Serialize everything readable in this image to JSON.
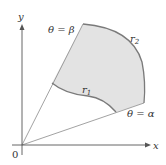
{
  "diagram": {
    "type": "polar region",
    "axes": {
      "x_label": "x",
      "y_label": "y",
      "origin_label": "0"
    },
    "rays": [
      {
        "id": "alpha",
        "label": "θ = α"
      },
      {
        "id": "beta",
        "label": "θ = β"
      }
    ],
    "curves": [
      {
        "id": "r1",
        "label": "r",
        "subscript": "1",
        "role": "inner boundary"
      },
      {
        "id": "r2",
        "label": "r",
        "subscript": "2",
        "role": "outer boundary"
      }
    ],
    "colors": {
      "region_fill": "#e3e3e3",
      "boundary": "#7a7a7a",
      "ray": "#8a8a8a",
      "axis": "#555555"
    }
  }
}
